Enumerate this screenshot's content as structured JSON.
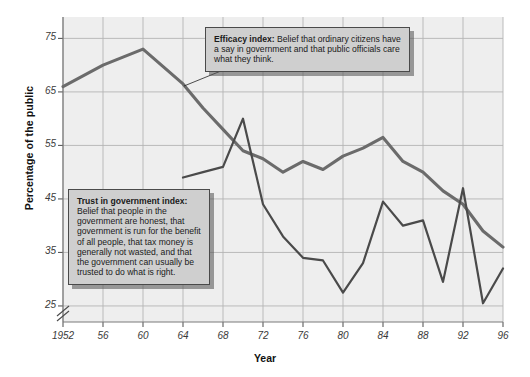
{
  "chart_data": {
    "type": "line",
    "title": "",
    "xlabel": "Year",
    "ylabel": "Percentage of the public",
    "xlim": [
      1952,
      1996
    ],
    "ylim": [
      22,
      79
    ],
    "grid": true,
    "axis_break": true,
    "legend_position": "annotations",
    "xticks": [
      "1952",
      "56",
      "60",
      "64",
      "68",
      "72",
      "76",
      "80",
      "84",
      "88",
      "92",
      "96"
    ],
    "xtick_values": [
      1952,
      1956,
      1960,
      1964,
      1968,
      1972,
      1976,
      1980,
      1984,
      1988,
      1992,
      1996
    ],
    "yticks": [
      "25",
      "35",
      "45",
      "55",
      "65",
      "75"
    ],
    "ytick_values": [
      25,
      35,
      45,
      55,
      65,
      75
    ],
    "series": [
      {
        "name": "Efficacy index",
        "color": "#6b6b6b",
        "x": [
          1952,
          1956,
          1958,
          1960,
          1964,
          1966,
          1968,
          1970,
          1972,
          1974,
          1976,
          1978,
          1980,
          1982,
          1984,
          1986,
          1988,
          1990,
          1992,
          1994,
          1996
        ],
        "values": [
          66,
          70,
          71.5,
          73,
          66.5,
          62,
          58,
          54,
          52.5,
          50,
          52,
          50.5,
          53,
          54.5,
          56.5,
          52,
          50,
          46.5,
          44,
          39,
          36
        ]
      },
      {
        "name": "Trust in government index",
        "color": "#4a4a4a",
        "x": [
          1964,
          1966,
          1968,
          1970,
          1972,
          1974,
          1976,
          1978,
          1980,
          1982,
          1984,
          1986,
          1988,
          1990,
          1992,
          1994,
          1996
        ],
        "values": [
          49,
          50,
          51,
          60,
          44,
          38,
          34,
          33.5,
          27.5,
          33,
          44.5,
          40,
          41,
          29.5,
          47,
          25.5,
          32
        ]
      }
    ]
  },
  "annotations": {
    "efficacy": {
      "title": "Efficacy index:",
      "body": "Belief that ordinary citizens have a say in government and that public officials care what they think."
    },
    "trust": {
      "title": "Trust in government index:",
      "body": "Belief that people in the government are honest, that government is run for the benefit of all people, that tax money is generally not wasted, and that the government can usually be trusted to do what is right."
    }
  }
}
